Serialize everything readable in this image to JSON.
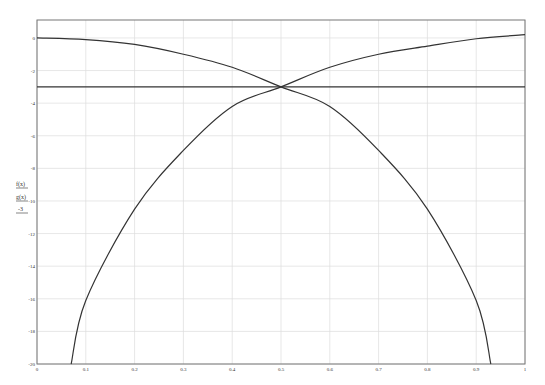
{
  "chart_data": {
    "type": "line",
    "title": "",
    "xlabel": "",
    "ylabel": "",
    "xlim": [
      0,
      1
    ],
    "ylim": [
      -20,
      1.1
    ],
    "grid": true,
    "legend_position": "left-vertical",
    "x_ticks": [
      0,
      0.1,
      0.2,
      0.3,
      0.4,
      0.5,
      0.6,
      0.7,
      0.8,
      0.9,
      1
    ],
    "x_tick_labels": [
      "0",
      "0.1",
      "0.2",
      "0.3",
      "0.4",
      "0.5",
      "0.6",
      "0.7",
      "0.8",
      "0.9",
      "1"
    ],
    "y_ticks": [
      0,
      -2,
      -4,
      -6,
      -8,
      -10,
      -12,
      -14,
      -16,
      -18,
      -20
    ],
    "y_tick_labels": [
      "0",
      "-2",
      "-4",
      "-6",
      "-8",
      "-10",
      "-12",
      "-14",
      "-16",
      "-18",
      "-20"
    ],
    "series": [
      {
        "name": "f(x)",
        "color": "#333333",
        "x": [
          0,
          0.1,
          0.2,
          0.3,
          0.4,
          0.5,
          0.6,
          0.7,
          0.8,
          0.9,
          0.93
        ],
        "y": [
          0,
          -0.1,
          -0.4,
          -1.0,
          -1.8,
          -3.0,
          -4.2,
          -6.9,
          -10.5,
          -16.1,
          -20
        ]
      },
      {
        "name": "g(x)",
        "color": "#333333",
        "x": [
          0.07,
          0.1,
          0.2,
          0.3,
          0.4,
          0.5,
          0.6,
          0.7,
          0.8,
          0.9,
          1.0
        ],
        "y": [
          -20,
          -16.1,
          -10.5,
          -6.9,
          -4.2,
          -3.0,
          -1.8,
          -1.0,
          -0.5,
          -0.05,
          0.2
        ]
      },
      {
        "name": "-3",
        "color": "#333333",
        "x": [
          0,
          1
        ],
        "y": [
          -3,
          -3
        ]
      }
    ],
    "legend": [
      "f(x)",
      "g(x)",
      "-3"
    ]
  },
  "legend": {
    "items": [
      "f(x)",
      "g(x)",
      "-3"
    ]
  }
}
